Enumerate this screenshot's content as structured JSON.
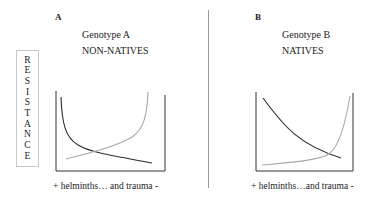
{
  "panels": [
    {
      "letter": "A",
      "genotype": "Genotype A",
      "group": "NON-NATIVES",
      "x_axis_label": "+  helminths… and trauma  -"
    },
    {
      "letter": "B",
      "genotype": "Genotype B",
      "group": "NATIVES",
      "x_axis_label": "+  helminths…and trauma -"
    }
  ],
  "y_axis_label": "RESISTANCE",
  "y_axis_letters": [
    "R",
    "E",
    "S",
    "I",
    "S",
    "T",
    "A",
    "N",
    "C",
    "E"
  ],
  "colors": {
    "dark_curve": "#2b2b2b",
    "light_curve": "#a8a8a8",
    "axis": "#333333",
    "divider": "#9a9a9a"
  }
}
